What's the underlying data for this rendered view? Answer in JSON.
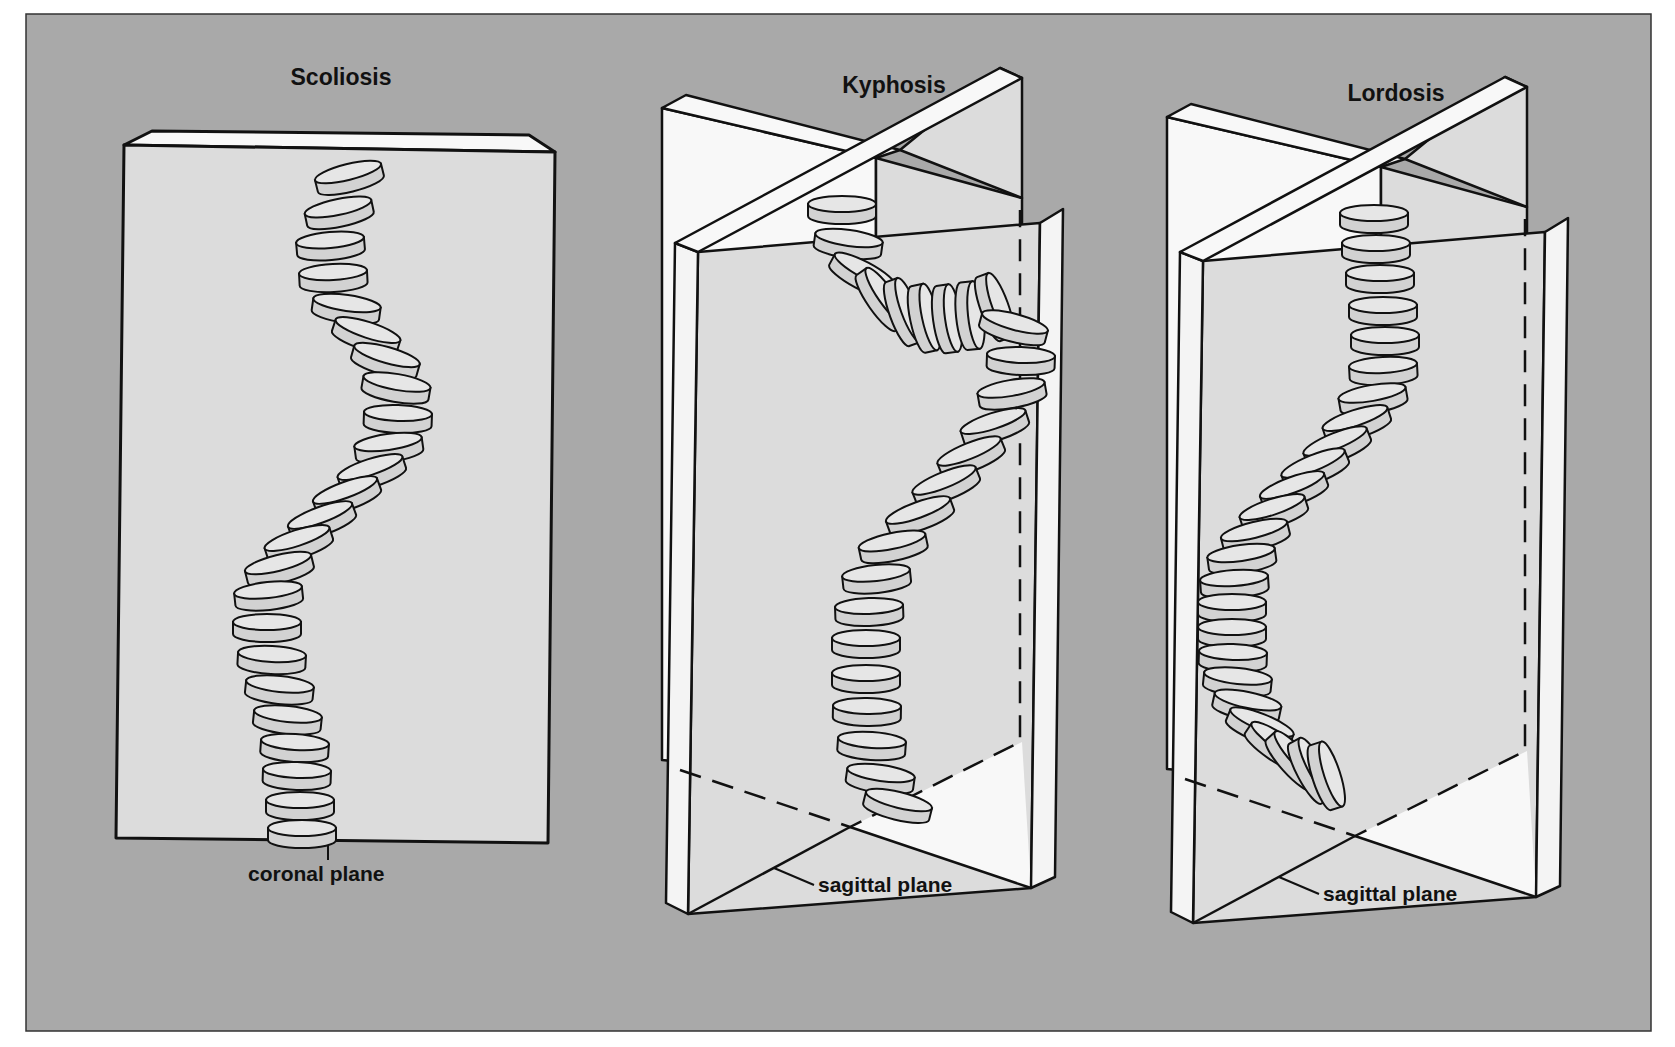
{
  "figure": {
    "background_color": "#a9a9a9",
    "panel_white": "#f8f8f8",
    "panel_face": "#dcdcdc",
    "vertebra_fill": "#d2d2d2",
    "vertebra_top": "#e6e6e6",
    "line_color": "#111111"
  },
  "panels": [
    {
      "id": "scoliosis",
      "title": "Scoliosis",
      "plane_label": "coronal plane",
      "vertebrae": [
        [
          348,
          172,
          -14
        ],
        [
          338,
          207,
          -12
        ],
        [
          330,
          240,
          -5
        ],
        [
          333,
          272,
          -3
        ],
        [
          347,
          303,
          8
        ],
        [
          368,
          330,
          18
        ],
        [
          387,
          355,
          16
        ],
        [
          397,
          382,
          10
        ],
        [
          398,
          413,
          2
        ],
        [
          388,
          442,
          -8
        ],
        [
          370,
          467,
          -18
        ],
        [
          345,
          490,
          -20
        ],
        [
          320,
          515,
          -20
        ],
        [
          297,
          538,
          -18
        ],
        [
          278,
          563,
          -14
        ],
        [
          268,
          590,
          -6
        ],
        [
          267,
          622,
          0
        ],
        [
          272,
          654,
          3
        ],
        [
          280,
          684,
          6
        ],
        [
          288,
          714,
          6
        ],
        [
          295,
          742,
          4
        ],
        [
          297,
          770,
          2
        ],
        [
          300,
          800,
          0
        ],
        [
          302,
          828,
          0
        ]
      ]
    },
    {
      "id": "kyphosis",
      "title": "Kyphosis",
      "plane_label": "sagittal plane",
      "vertebrae": [
        [
          842,
          204,
          0
        ],
        [
          849,
          238,
          8
        ],
        [
          865,
          270,
          28
        ],
        [
          886,
          296,
          55
        ],
        [
          909,
          310,
          70
        ],
        [
          930,
          317,
          78
        ],
        [
          953,
          318,
          82
        ],
        [
          976,
          315,
          84
        ],
        [
          1000,
          305,
          70
        ],
        [
          1015,
          322,
          15
        ],
        [
          1021,
          355,
          2
        ],
        [
          1011,
          388,
          -10
        ],
        [
          993,
          421,
          -18
        ],
        [
          969,
          451,
          -22
        ],
        [
          944,
          480,
          -22
        ],
        [
          918,
          510,
          -20
        ],
        [
          892,
          541,
          -12
        ],
        [
          876,
          573,
          -6
        ],
        [
          869,
          606,
          -2
        ],
        [
          866,
          638,
          0
        ],
        [
          866,
          673,
          0
        ],
        [
          867,
          706,
          1
        ],
        [
          872,
          740,
          4
        ],
        [
          881,
          773,
          8
        ],
        [
          899,
          800,
          14
        ]
      ]
    },
    {
      "id": "lordosis",
      "title": "Lordosis",
      "plane_label": "sagittal plane",
      "vertebrae": [
        [
          1374,
          213,
          0
        ],
        [
          1376,
          243,
          0
        ],
        [
          1380,
          273,
          0
        ],
        [
          1383,
          305,
          0
        ],
        [
          1385,
          335,
          0
        ],
        [
          1383,
          365,
          -3
        ],
        [
          1372,
          393,
          -10
        ],
        [
          1355,
          418,
          -18
        ],
        [
          1335,
          441,
          -22
        ],
        [
          1313,
          463,
          -22
        ],
        [
          1292,
          485,
          -20
        ],
        [
          1272,
          507,
          -18
        ],
        [
          1254,
          530,
          -14
        ],
        [
          1241,
          553,
          -8
        ],
        [
          1234,
          578,
          -4
        ],
        [
          1232,
          602,
          0
        ],
        [
          1232,
          627,
          0
        ],
        [
          1233,
          652,
          2
        ],
        [
          1238,
          676,
          6
        ],
        [
          1248,
          700,
          12
        ],
        [
          1262,
          722,
          22
        ],
        [
          1280,
          742,
          34
        ],
        [
          1298,
          757,
          48
        ],
        [
          1316,
          768,
          62
        ],
        [
          1332,
          774,
          72
        ]
      ]
    }
  ]
}
